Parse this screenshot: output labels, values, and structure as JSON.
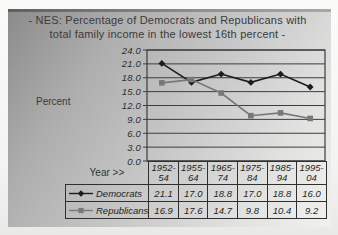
{
  "header": {
    "title_line1": "- NES: Percentage of Democrats and Republicans with",
    "title_line2": "total family income in the lowest 16th percent -"
  },
  "axes": {
    "y_axis_title": "Percent",
    "x_axis_title": "Year >>"
  },
  "chart_data": {
    "type": "line",
    "title": "NES: Percentage of Democrats and Republicans with total family income in the lowest 16th percent",
    "categories": [
      "1952-54",
      "1955-64",
      "1965-74",
      "1975-84",
      "1985-94",
      "1995-04"
    ],
    "series": [
      {
        "name": "Democrats",
        "values": [
          21.1,
          17.0,
          18.8,
          17.0,
          18.8,
          16.0
        ],
        "color": "#1c1c1c",
        "marker": "diamond"
      },
      {
        "name": "Republicans",
        "values": [
          16.9,
          17.6,
          14.7,
          9.8,
          10.4,
          9.2
        ],
        "color": "#787878",
        "marker": "square"
      }
    ],
    "xlabel": "Year >>",
    "ylabel": "Percent",
    "ylim": [
      0,
      24
    ],
    "ytick_step": 3,
    "yticks": [
      "24.0",
      "21.0",
      "18.0",
      "15.0",
      "12.0",
      "9.0",
      "6.0",
      "3.0",
      "0.0"
    ],
    "grid": true,
    "legend_position": "table-below-plot"
  },
  "table": {
    "years": [
      "1952-\n54",
      "1955-\n64",
      "1965-\n74",
      "1975-\n84",
      "1985-\n94",
      "1995-\n04"
    ],
    "rows": [
      {
        "label": "Democrats",
        "values": [
          "21.1",
          "17.0",
          "18.8",
          "17.0",
          "18.8",
          "16.0"
        ]
      },
      {
        "label": "Republicans",
        "values": [
          "16.9",
          "17.6",
          "14.7",
          "9.8",
          "10.4",
          "9.2"
        ]
      }
    ]
  },
  "colors": {
    "democrats": "#1c1c1c",
    "republicans": "#787878",
    "grid_line": "#3d3d3d",
    "table_border": "#2f2f2f",
    "text": "#333333"
  }
}
